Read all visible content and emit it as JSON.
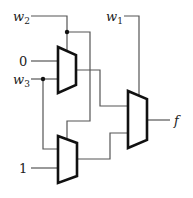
{
  "diagram": {
    "type": "multiplexer-circuit",
    "inputs": {
      "w2": {
        "name": "w",
        "sub": "2"
      },
      "zero": {
        "text": "0"
      },
      "w3": {
        "name": "w",
        "sub": "3"
      },
      "one": {
        "text": "1"
      },
      "w1": {
        "name": "w",
        "sub": "1"
      }
    },
    "output": {
      "text": "f"
    },
    "components": [
      "mux-top",
      "mux-bottom",
      "mux-final"
    ],
    "colors": {
      "wire": "#555555",
      "mux_outline": "#111111"
    }
  }
}
